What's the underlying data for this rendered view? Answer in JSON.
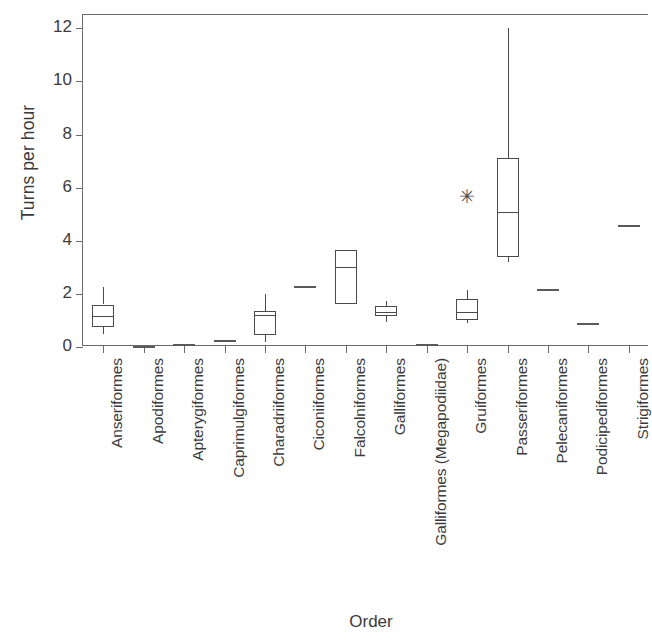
{
  "chart_data": {
    "type": "box",
    "title": "",
    "xlabel": "Order",
    "ylabel": "Turns per hour",
    "ylim": [
      0,
      12.5
    ],
    "yticks": [
      0,
      2,
      4,
      6,
      8,
      10,
      12
    ],
    "grid": false,
    "legend": "none",
    "categories": [
      "Anseriformes",
      "Apodiformes",
      "Apterygiformes",
      "Caprimulgiformes",
      "Charadriiformes",
      "Ciconiiformes",
      "Falcolniformes",
      "Galliformes",
      "Galliformes (Megapodiidae)",
      "Gruiformes",
      "Passeriformes",
      "Pelecaniformes",
      "Podicipediformes",
      "Strigiformes"
    ],
    "boxes": [
      {
        "category": "Anseriformes",
        "kind": "box",
        "whisker_low": 0.5,
        "q1": 0.75,
        "median": 1.15,
        "q3": 1.6,
        "whisker_high": 2.25,
        "outliers": []
      },
      {
        "category": "Apodiformes",
        "kind": "line",
        "median": 0.05,
        "outliers": []
      },
      {
        "category": "Apterygiformes",
        "kind": "line",
        "median": 0.1,
        "outliers": []
      },
      {
        "category": "Caprimulgiformes",
        "kind": "line",
        "median": 0.25,
        "outliers": []
      },
      {
        "category": "Charadriiformes",
        "kind": "box",
        "whisker_low": 0.2,
        "q1": 0.45,
        "median": 1.2,
        "q3": 1.35,
        "whisker_high": 2.0,
        "outliers": []
      },
      {
        "category": "Ciconiiformes",
        "kind": "line",
        "median": 2.3,
        "outliers": []
      },
      {
        "category": "Falcolniformes",
        "kind": "box",
        "whisker_low": 1.6,
        "q1": 1.6,
        "median": 3.0,
        "q3": 3.65,
        "whisker_high": 3.65,
        "outliers": []
      },
      {
        "category": "Galliformes",
        "kind": "box",
        "whisker_low": 0.95,
        "q1": 1.15,
        "median": 1.3,
        "q3": 1.55,
        "whisker_high": 1.75,
        "outliers": []
      },
      {
        "category": "Galliformes (Megapodiidae)",
        "kind": "line",
        "median": 0.1,
        "outliers": []
      },
      {
        "category": "Gruiformes",
        "kind": "box",
        "whisker_low": 0.9,
        "q1": 1.0,
        "median": 1.3,
        "q3": 1.8,
        "whisker_high": 2.15,
        "outliers": [
          5.7
        ]
      },
      {
        "category": "Passeriformes",
        "kind": "box",
        "whisker_low": 3.2,
        "q1": 3.4,
        "median": 5.1,
        "q3": 7.1,
        "whisker_high": 12.0,
        "outliers": []
      },
      {
        "category": "Pelecaniformes",
        "kind": "line",
        "median": 2.2,
        "outliers": []
      },
      {
        "category": "Podicipediformes",
        "kind": "line",
        "median": 0.9,
        "outliers": []
      },
      {
        "category": "Strigiformes",
        "kind": "line",
        "median": 4.6,
        "outliers": []
      }
    ],
    "outlier_marker": "✳",
    "colors": {
      "line": "#4a4a4a",
      "axis": "#6b6b6b",
      "text": "#3b3b3b",
      "background": "#ffffff"
    }
  }
}
